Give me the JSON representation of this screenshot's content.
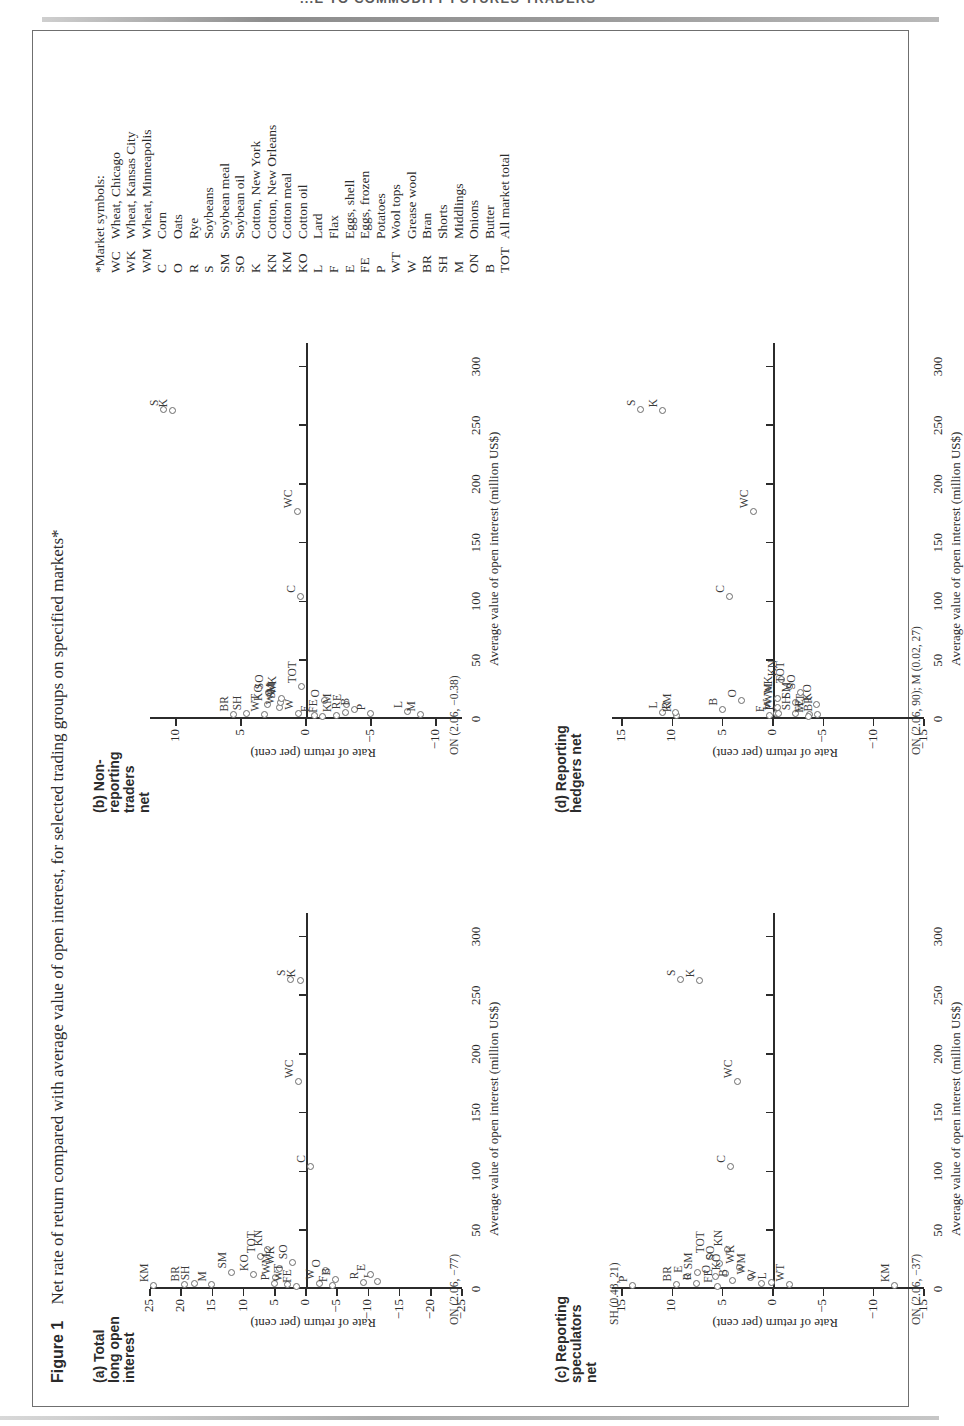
{
  "page": {
    "running_header": "...E TO COMMODITY FUTURES TRADERS"
  },
  "figure": {
    "number_label": "Figure 1",
    "caption": "Net rate of return compared with average value of open interest, for selected trading groups on specified markets*",
    "x_axis_title": "Average value of open interest (million US$)",
    "y_axis_title": "Rate of return (per cent)"
  },
  "symbol_key": {
    "heading": "*Market symbols:",
    "entries": [
      {
        "symbol": "WC",
        "name": "Wheat, Chicago"
      },
      {
        "symbol": "WK",
        "name": "Wheat, Kansas City"
      },
      {
        "symbol": "WM",
        "name": "Wheat, Minneapolis"
      },
      {
        "symbol": "C",
        "name": "Corn"
      },
      {
        "symbol": "O",
        "name": "Oats"
      },
      {
        "symbol": "R",
        "name": "Rye"
      },
      {
        "symbol": "S",
        "name": "Soybeans"
      },
      {
        "symbol": "SM",
        "name": "Soybean meal"
      },
      {
        "symbol": "SO",
        "name": "Soybean oil"
      },
      {
        "symbol": "K",
        "name": "Cotton, New York"
      },
      {
        "symbol": "KN",
        "name": "Cotton, New Orleans"
      },
      {
        "symbol": "KM",
        "name": "Cotton meal"
      },
      {
        "symbol": "KO",
        "name": "Cotton oil"
      },
      {
        "symbol": "L",
        "name": "Lard"
      },
      {
        "symbol": "F",
        "name": "Flax"
      },
      {
        "symbol": "E",
        "name": "Eggs, shell"
      },
      {
        "symbol": "FE",
        "name": "Eggs, frozen"
      },
      {
        "symbol": "P",
        "name": "Potatoes"
      },
      {
        "symbol": "WT",
        "name": "Wool tops"
      },
      {
        "symbol": "W",
        "name": "Grease wool"
      },
      {
        "symbol": "BR",
        "name": "Bran"
      },
      {
        "symbol": "SH",
        "name": "Shorts"
      },
      {
        "symbol": "M",
        "name": "Middlings"
      },
      {
        "symbol": "ON",
        "name": "Onions"
      },
      {
        "symbol": "B",
        "name": "Butter"
      },
      {
        "symbol": "TOT",
        "name": "All market total"
      }
    ]
  },
  "chart_data": [
    {
      "id": "a",
      "type": "scatter",
      "title": "(a) Total\nlong open\ninterest",
      "title_lines": [
        "(a) Total",
        "long open",
        "interest"
      ],
      "xlabel": "Average value of open interest (million US$)",
      "ylabel": "Rate of return (per cent)",
      "xlim": [
        0,
        320
      ],
      "ylim": [
        -25,
        25
      ],
      "xticks": [
        0,
        50,
        100,
        150,
        200,
        250,
        300
      ],
      "yticks": [
        -25,
        -20,
        -15,
        -10,
        -5,
        0,
        5,
        10,
        15,
        20,
        25
      ],
      "grid": false,
      "annotation": "ON (2.06, −77)",
      "points": [
        {
          "label": "KM",
          "x": 2.5,
          "y": 24.5
        },
        {
          "label": "BR",
          "x": 3.0,
          "y": 19.5
        },
        {
          "label": "SH",
          "x": 4.0,
          "y": 18.0
        },
        {
          "label": "M",
          "x": 3.0,
          "y": 15.2
        },
        {
          "label": "SM",
          "x": 14.0,
          "y": 12.0
        },
        {
          "label": "KO",
          "x": 12.0,
          "y": 8.5
        },
        {
          "label": "TOT",
          "x": 27.0,
          "y": 7.3
        },
        {
          "label": "KN",
          "x": 33.0,
          "y": 6.2
        },
        {
          "label": "P",
          "x": 4.0,
          "y": 5.2
        },
        {
          "label": "WM",
          "x": 9.0,
          "y": 5.0
        },
        {
          "label": "WK",
          "x": 17.0,
          "y": 4.4
        },
        {
          "label": "WT",
          "x": 3.0,
          "y": 3.0
        },
        {
          "label": "SO",
          "x": 22.0,
          "y": 2.2
        },
        {
          "label": "FE",
          "x": 2.0,
          "y": 1.6
        },
        {
          "label": "W",
          "x": 4.5,
          "y": -2.1
        },
        {
          "label": "O",
          "x": 15.0,
          "y": -3.0
        },
        {
          "label": "F",
          "x": 2.5,
          "y": -4.2
        },
        {
          "label": "B",
          "x": 8.0,
          "y": -4.6
        },
        {
          "label": "R",
          "x": 5.0,
          "y": -9.2
        },
        {
          "label": "L",
          "x": 6.0,
          "y": -11.4
        },
        {
          "label": "E",
          "x": 12.0,
          "y": -10.3
        },
        {
          "label": "WC",
          "x": 176.0,
          "y": 1.3
        },
        {
          "label": "C",
          "x": 104.0,
          "y": -0.7
        },
        {
          "label": "S",
          "x": 263.0,
          "y": 2.6
        },
        {
          "label": "K",
          "x": 262.0,
          "y": 0.9
        }
      ]
    },
    {
      "id": "b",
      "type": "scatter",
      "title_lines": [
        "(b) Non-",
        "reporting",
        "traders",
        "net"
      ],
      "xlabel": "Average value of open interest (million US$)",
      "ylabel": "Rate of return (per cent)",
      "xlim": [
        0,
        320
      ],
      "ylim": [
        -12,
        12
      ],
      "xticks": [
        0,
        50,
        100,
        150,
        200,
        250,
        300
      ],
      "yticks": [
        -10,
        -5,
        0,
        5,
        10
      ],
      "grid": false,
      "annotation": "ON (2.06, −0.38)",
      "points": [
        {
          "label": "BR",
          "x": 3.0,
          "y": 5.6
        },
        {
          "label": "SH",
          "x": 4.0,
          "y": 4.6
        },
        {
          "label": "WT",
          "x": 3.0,
          "y": 3.2
        },
        {
          "label": "KO",
          "x": 12.0,
          "y": 3.0
        },
        {
          "label": "SO",
          "x": 22.0,
          "y": 2.9
        },
        {
          "label": "WM",
          "x": 9.0,
          "y": 2.1
        },
        {
          "label": "SM",
          "x": 14.0,
          "y": 2.0
        },
        {
          "label": "WK",
          "x": 17.0,
          "y": 1.9
        },
        {
          "label": "W",
          "x": 4.5,
          "y": 0.6
        },
        {
          "label": "TOT",
          "x": 27.0,
          "y": 0.4
        },
        {
          "label": "FE",
          "x": 2.0,
          "y": -1.2
        },
        {
          "label": "O",
          "x": 15.0,
          "y": -1.4
        },
        {
          "label": "F",
          "x": 2.5,
          "y": -0.6
        },
        {
          "label": "KM",
          "x": 2.5,
          "y": -2.3
        },
        {
          "label": "R",
          "x": 5.0,
          "y": -3.0
        },
        {
          "label": "E",
          "x": 12.0,
          "y": -3.1
        },
        {
          "label": "B",
          "x": 8.0,
          "y": -3.7
        },
        {
          "label": "P",
          "x": 4.0,
          "y": -4.9
        },
        {
          "label": "L",
          "x": 6.0,
          "y": -7.8
        },
        {
          "label": "M",
          "x": 3.0,
          "y": -8.8
        },
        {
          "label": "WC",
          "x": 176.0,
          "y": 0.7
        },
        {
          "label": "C",
          "x": 104.0,
          "y": 0.5
        },
        {
          "label": "S",
          "x": 263.0,
          "y": 11.0
        },
        {
          "label": "K",
          "x": 262.0,
          "y": 10.3
        }
      ]
    },
    {
      "id": "c",
      "type": "scatter",
      "title_lines": [
        "(c) Reporting",
        "speculators",
        "net"
      ],
      "xlabel": "Average value of open interest (million US$)",
      "ylabel": "Rate of return (per cent)",
      "xlim": [
        0,
        320
      ],
      "ylim": [
        -15,
        16
      ],
      "xticks": [
        0,
        50,
        100,
        150,
        200,
        250,
        300
      ],
      "yticks": [
        -15,
        -10,
        -5,
        0,
        5,
        10,
        15
      ],
      "grid": false,
      "annotations": [
        "SH (0.48, 21)",
        "ON (2.06, −37)"
      ],
      "points": [
        {
          "label": "P",
          "x": 2.5,
          "y": 14.0
        },
        {
          "label": "BR",
          "x": 3.0,
          "y": 9.6
        },
        {
          "label": "E",
          "x": 10.5,
          "y": 8.5
        },
        {
          "label": "R",
          "x": 4.0,
          "y": 7.7
        },
        {
          "label": "SM",
          "x": 13.5,
          "y": 7.6
        },
        {
          "label": "TOT",
          "x": 27.0,
          "y": 6.4
        },
        {
          "label": "FE",
          "x": 2.0,
          "y": 5.6
        },
        {
          "label": "O",
          "x": 10.0,
          "y": 5.8
        },
        {
          "label": "SO",
          "x": 21.0,
          "y": 5.4
        },
        {
          "label": "KO",
          "x": 12.5,
          "y": 4.8
        },
        {
          "label": "KN",
          "x": 33.0,
          "y": 4.6
        },
        {
          "label": "B",
          "x": 7.0,
          "y": 4.1
        },
        {
          "label": "WK",
          "x": 18.0,
          "y": 3.4
        },
        {
          "label": "WM",
          "x": 9.0,
          "y": 2.3
        },
        {
          "label": "W",
          "x": 4.0,
          "y": 1.2
        },
        {
          "label": "L",
          "x": 5.0,
          "y": 0.2
        },
        {
          "label": "WT",
          "x": 3.0,
          "y": -1.6
        },
        {
          "label": "KM",
          "x": 2.5,
          "y": -12.0
        },
        {
          "label": "C",
          "x": 104.0,
          "y": 4.3
        },
        {
          "label": "WC",
          "x": 176.0,
          "y": 3.6
        },
        {
          "label": "S",
          "x": 263.0,
          "y": 9.2
        },
        {
          "label": "K",
          "x": 262.0,
          "y": 7.4
        }
      ]
    },
    {
      "id": "d",
      "type": "scatter",
      "title_lines": [
        "(d) Reporting",
        "hedgers net"
      ],
      "xlabel": "Average value of open interest (million US$)",
      "ylabel": "Rate of return (per cent)",
      "xlim": [
        0,
        320
      ],
      "ylim": [
        -15,
        16
      ],
      "xticks": [
        0,
        50,
        100,
        150,
        200,
        250,
        300
      ],
      "yticks": [
        -15,
        -10,
        -5,
        0,
        5,
        10,
        15
      ],
      "grid": false,
      "annotation": "ON (2.06, 90); M (0.02, 27)",
      "points": [
        {
          "label": "L",
          "x": 5.5,
          "y": 11.0
        },
        {
          "label": "KM",
          "x": 2.5,
          "y": 9.6
        },
        {
          "label": "R",
          "x": 5.0,
          "y": 9.7
        },
        {
          "label": "B",
          "x": 8.0,
          "y": 5.1
        },
        {
          "label": "O",
          "x": 15.0,
          "y": 3.2
        },
        {
          "label": "F",
          "x": 2.5,
          "y": 0.4
        },
        {
          "label": "W",
          "x": 4.5,
          "y": -0.3
        },
        {
          "label": "P",
          "x": 4.0,
          "y": -0.5
        },
        {
          "label": "WM",
          "x": 9.0,
          "y": -0.4
        },
        {
          "label": "WK",
          "x": 17.0,
          "y": -0.4
        },
        {
          "label": "KN",
          "x": 33.0,
          "y": -0.8
        },
        {
          "label": "TOT",
          "x": 27.0,
          "y": -1.6
        },
        {
          "label": "SH",
          "x": 4.0,
          "y": -2.2
        },
        {
          "label": "SM",
          "x": 14.0,
          "y": -2.2
        },
        {
          "label": "SO",
          "x": 22.0,
          "y": -2.7
        },
        {
          "label": "WT",
          "x": 3.0,
          "y": -3.6
        },
        {
          "label": "FE",
          "x": 2.0,
          "y": -3.5
        },
        {
          "label": "BR",
          "x": 3.0,
          "y": -4.4
        },
        {
          "label": "KO",
          "x": 12.0,
          "y": -4.3
        },
        {
          "label": "C",
          "x": 104.0,
          "y": 4.4
        },
        {
          "label": "WC",
          "x": 176.0,
          "y": 2.0
        },
        {
          "label": "S",
          "x": 263.0,
          "y": 13.2
        },
        {
          "label": "K",
          "x": 262.0,
          "y": 11.0
        }
      ]
    }
  ]
}
